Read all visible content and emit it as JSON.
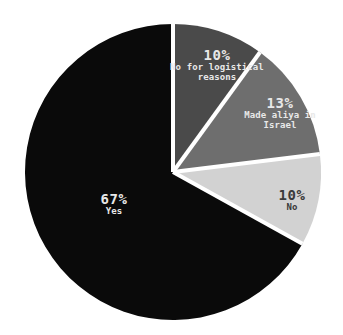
{
  "chart_data": {
    "type": "pie",
    "title": "",
    "subtitle": "",
    "xlabel": "",
    "ylabel": "",
    "legend": "none",
    "grid": false,
    "start_angle_deg": 0,
    "direction": "clockwise",
    "categories": [
      "No for logistical reasons",
      "Made aliya in Israel",
      "No",
      "Yes"
    ],
    "values": [
      10,
      13,
      10,
      67
    ],
    "value_unit": "%",
    "slices": [
      {
        "label": "No for logistical reasons",
        "value": 10,
        "pct_text": "10%",
        "color": "#4a4a4a",
        "label_color": "light",
        "start_deg": 0,
        "end_deg": 36
      },
      {
        "label": "Made aliya in Israel",
        "value": 13,
        "pct_text": "13%",
        "color": "#6e6e6e",
        "label_color": "light",
        "start_deg": 36,
        "end_deg": 83
      },
      {
        "label": "No",
        "value": 10,
        "pct_text": "10%",
        "color": "#d2d2d2",
        "label_color": "dark",
        "start_deg": 83,
        "end_deg": 119
      },
      {
        "label": "Yes",
        "value": 67,
        "pct_text": "67%",
        "color": "#0a0a0a",
        "label_color": "light",
        "start_deg": 119,
        "end_deg": 360
      }
    ],
    "labels": {
      "logistical": {
        "pct": "10%",
        "line1": "No for logistical",
        "line2": "reasons"
      },
      "aliya": {
        "pct": "13%",
        "line1": "Made aliya in",
        "line2": "Israel"
      },
      "no": {
        "pct": "10%",
        "line1": "No",
        "line2": ""
      },
      "yes": {
        "pct": "67%",
        "line1": "Yes",
        "line2": ""
      }
    },
    "colors": {
      "background": "#ffffff",
      "separator": "#ffffff",
      "slice_dark_gray": "#4a4a4a",
      "slice_mid_gray": "#6e6e6e",
      "slice_light_gray": "#d2d2d2",
      "slice_black": "#0a0a0a",
      "label_on_dark": "#e8e8e8",
      "label_on_light": "#3a3a3a"
    },
    "geometry": {
      "center_x": 173,
      "center_y": 172,
      "radius": 148
    }
  }
}
